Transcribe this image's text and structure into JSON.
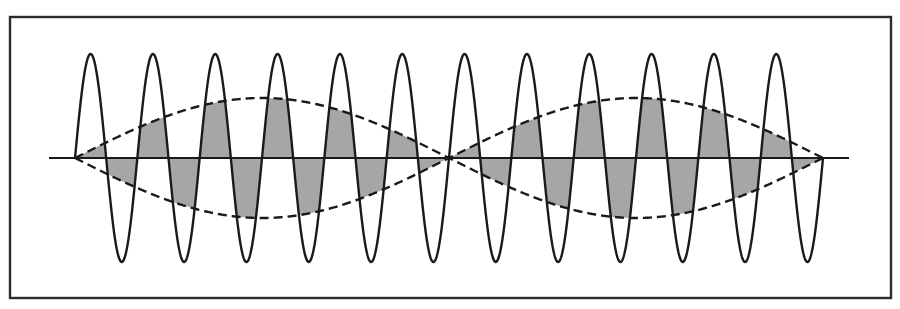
{
  "figure": {
    "frame": {
      "x": 10,
      "y": 17,
      "width": 881,
      "height": 281
    },
    "axis": {
      "x1": 49,
      "x2": 849,
      "y": 158
    },
    "carrier": {
      "x_start": 75,
      "x_end": 823,
      "center_y": 158,
      "amplitude_px": 104,
      "cycles": 12,
      "peaks_visible": 12,
      "troughs_visible": 12
    },
    "envelope": {
      "style": "dashed",
      "x_start": 75,
      "x_end": 823,
      "center_y": 158,
      "amplitude_px": 60,
      "half_periods": 2,
      "nodes_x": [
        75,
        449,
        823
      ]
    },
    "colors": {
      "line": "#1a1a1a",
      "frame": "#2b2b2b",
      "shade": "#a6a6a6",
      "background": "#ffffff"
    }
  }
}
